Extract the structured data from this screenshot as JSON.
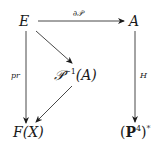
{
  "diagram": {
    "type": "commutative-diagram",
    "nodes": {
      "E": {
        "text": "E"
      },
      "A": {
        "text": "A"
      },
      "Pinv": {
        "base": "𝒫",
        "sup": "−1",
        "arg": "(A)"
      },
      "FX": {
        "text": "F(X)"
      },
      "P4star": {
        "open": "(",
        "base": "P",
        "sup": "4",
        "close": ")",
        "star": "*"
      }
    },
    "arrows": [
      {
        "from": "E",
        "to": "A",
        "label": "∂𝒫"
      },
      {
        "from": "E",
        "to": "F(X)",
        "label": "pr"
      },
      {
        "from": "E",
        "to": "𝒫⁻¹(A)",
        "label": ""
      },
      {
        "from": "𝒫⁻¹(A)",
        "to": "F(X)",
        "label": ""
      },
      {
        "from": "A",
        "to": "(P⁴)*",
        "label": "H"
      }
    ],
    "colors": {
      "ink": "#1a1a1a",
      "background": "#ffffff"
    }
  }
}
